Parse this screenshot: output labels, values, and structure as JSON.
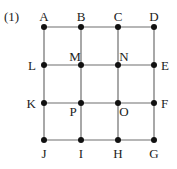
{
  "problem_label": "(1)",
  "colors": {
    "line": "#6e6e6e",
    "point": "#111111",
    "text": "#222222"
  },
  "grid": {
    "cols_x": [
      44,
      81,
      118,
      154
    ],
    "rows_y": [
      27,
      65,
      103,
      140
    ]
  },
  "points": [
    {
      "name": "A",
      "x": 44,
      "y": 27,
      "lx": 44,
      "ly": 21,
      "anchor": "middle"
    },
    {
      "name": "B",
      "x": 81,
      "y": 27,
      "lx": 81,
      "ly": 21,
      "anchor": "middle"
    },
    {
      "name": "C",
      "x": 118,
      "y": 27,
      "lx": 118,
      "ly": 21,
      "anchor": "middle"
    },
    {
      "name": "D",
      "x": 154,
      "y": 27,
      "lx": 154,
      "ly": 21,
      "anchor": "middle"
    },
    {
      "name": "L",
      "x": 44,
      "y": 65,
      "lx": 36,
      "ly": 70,
      "anchor": "end"
    },
    {
      "name": "M",
      "x": 81,
      "y": 65,
      "lx": 75,
      "ly": 61,
      "anchor": "middle"
    },
    {
      "name": "N",
      "x": 118,
      "y": 65,
      "lx": 124,
      "ly": 61,
      "anchor": "middle"
    },
    {
      "name": "E",
      "x": 154,
      "y": 65,
      "lx": 161,
      "ly": 70,
      "anchor": "start"
    },
    {
      "name": "K",
      "x": 44,
      "y": 103,
      "lx": 36,
      "ly": 108,
      "anchor": "end"
    },
    {
      "name": "P",
      "x": 81,
      "y": 103,
      "lx": 73,
      "ly": 116,
      "anchor": "middle"
    },
    {
      "name": "O",
      "x": 118,
      "y": 103,
      "lx": 124,
      "ly": 116,
      "anchor": "middle"
    },
    {
      "name": "F",
      "x": 154,
      "y": 103,
      "lx": 161,
      "ly": 108,
      "anchor": "start"
    },
    {
      "name": "J",
      "x": 44,
      "y": 140,
      "lx": 44,
      "ly": 158,
      "anchor": "middle"
    },
    {
      "name": "I",
      "x": 81,
      "y": 140,
      "lx": 81,
      "ly": 158,
      "anchor": "middle"
    },
    {
      "name": "H",
      "x": 118,
      "y": 140,
      "lx": 118,
      "ly": 158,
      "anchor": "middle"
    },
    {
      "name": "G",
      "x": 154,
      "y": 140,
      "lx": 154,
      "ly": 158,
      "anchor": "middle"
    }
  ]
}
